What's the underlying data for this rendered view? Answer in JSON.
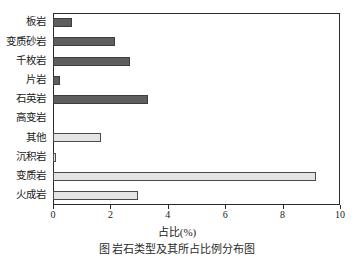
{
  "chart_data": {
    "type": "bar",
    "orientation": "horizontal",
    "title": "",
    "xlabel": "占比(%)",
    "ylabel": "",
    "xlim": [
      0,
      10
    ],
    "xticks": [
      0,
      2,
      4,
      6,
      8,
      10
    ],
    "xtick_labels": [
      "0",
      "2",
      "4",
      "6",
      "8",
      "10"
    ],
    "grid": false,
    "legend": false,
    "categories": [
      "板岩",
      "变质砂岩",
      "千枚岩",
      "片岩",
      "石英岩",
      "高变岩",
      "其他",
      "沉积岩",
      "变质岩",
      "火成岩"
    ],
    "values": [
      0.66,
      2.15,
      2.7,
      0.24,
      3.3,
      0.0,
      1.68,
      0.12,
      9.16,
      2.95
    ],
    "bar_styles": [
      "dark",
      "dark",
      "dark",
      "dark",
      "dark",
      "dark",
      "light",
      "light",
      "light",
      "light"
    ],
    "colors": {
      "dark_fill": "#5e5e5e",
      "light_fill": "#e4e4e4",
      "edge": "#3a3a3a",
      "axis": "#2b2b2b",
      "background": "#ffffff"
    }
  },
  "caption": {
    "text": "图  岩石类型及其所占比例分布图"
  }
}
